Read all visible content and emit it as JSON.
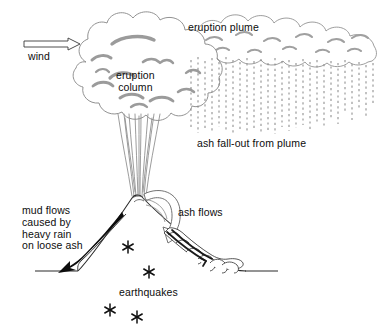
{
  "diagram": {
    "canvas": {
      "width": 379,
      "height": 334
    },
    "style": {
      "background": "#ffffff",
      "ink": "#1a1a1a",
      "outline_gray": "#7a7a7a",
      "shade_gray": "#9a9a9a",
      "fallout_gray": "#8c8c8c",
      "text": "#0d0d0d"
    }
  },
  "labels": {
    "eruption_plume": "eruption plume",
    "eruption_column_line1": "eruption",
    "eruption_column_line2": "column",
    "ash_fallout": "ash fall-out from plume",
    "wind": "wind",
    "ash_flows": "ash flows",
    "mud_flows_line1": "mud flows",
    "mud_flows_line2": "caused by",
    "mud_flows_line3": "heavy rain",
    "mud_flows_line4": "on loose ash",
    "earthquakes": "earthquakes"
  },
  "features": {
    "wind_arrow": {
      "name": "wind-direction-arrow",
      "direction": "right",
      "style": "hollow-outline"
    },
    "eruption_column": {
      "name": "eruption-column",
      "style": "vertical-streak-lines"
    },
    "eruption_cloud": {
      "name": "convective-cloud",
      "style": "billowing-cauliflower"
    },
    "plume": {
      "name": "downwind-ash-plume",
      "style": "billowing-cloud-band"
    },
    "ash_fallout": {
      "name": "ash-fallout-streaks",
      "style": "dashed-vertical-lines"
    },
    "volcano": {
      "name": "volcano-cone",
      "summit_x": 138,
      "summit_y": 195
    },
    "ground_line": {
      "name": "ground-surface",
      "y": 271
    },
    "ash_flow_arrow": {
      "name": "ash-flow-arrow",
      "style": "hollow-curved-arrow"
    },
    "ash_flow_deposit": {
      "name": "ash-flow-deposit",
      "style": "lobate-scalloped-tongue"
    },
    "mud_flow_arrow": {
      "name": "mud-flow-arrow",
      "style": "solid-tapering-curved-arrow"
    },
    "earthquake_symbols": {
      "name": "earthquake-asterisks",
      "glyph": "*",
      "count": 4
    }
  },
  "earthquake_points": [
    {
      "x": 128,
      "y": 247
    },
    {
      "x": 149,
      "y": 272
    },
    {
      "x": 110,
      "y": 310
    },
    {
      "x": 137,
      "y": 317
    }
  ]
}
